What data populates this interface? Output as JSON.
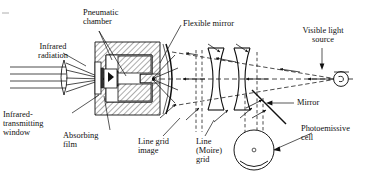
{
  "figure": {
    "type": "optical-schematic",
    "background_color": "#ffffff",
    "line_color": "#101010",
    "hatch_color": "#101010"
  },
  "labels": {
    "infrared_radiation": "Infrared\nradiation",
    "infrared_transmitting_window": "Infrared-\ntransmitting\nwindow",
    "absorbing_film": "Absorbing\nfilm",
    "pneumatic_chamber": "Pneumatic\nchamber",
    "flexible_mirror": "Flexible mirror",
    "line_grid_image": "Line grid\nimage",
    "line_moire_grid": "Line\n(Moire)\ngrid",
    "visible_light_source": "Visible light\nsource",
    "mirror": "Mirror",
    "photoemissive_cell": "Photoemissive\ncell"
  },
  "components": [
    {
      "name": "infrared-lens",
      "kind": "lens",
      "shape": "thin-biconvex"
    },
    {
      "name": "infrared-transmitting-window",
      "kind": "window"
    },
    {
      "name": "absorbing-film",
      "kind": "film"
    },
    {
      "name": "pneumatic-chamber",
      "kind": "hatched-body"
    },
    {
      "name": "flexible-mirror",
      "kind": "curved-mirror"
    },
    {
      "name": "line-grid-image",
      "kind": "grid-plane"
    },
    {
      "name": "lens-1",
      "kind": "lens",
      "shape": "biconvex"
    },
    {
      "name": "lens-2",
      "kind": "lens",
      "shape": "biconvex"
    },
    {
      "name": "line-moire-grid",
      "kind": "grid-plane"
    },
    {
      "name": "mirror",
      "kind": "plane-mirror",
      "angle_deg": 45
    },
    {
      "name": "visible-light-source",
      "kind": "lamp"
    },
    {
      "name": "photoemissive-cell",
      "kind": "detector"
    }
  ],
  "ray_counts": {
    "infrared_parallel_rays": 4,
    "cell_input_rays": 2
  }
}
